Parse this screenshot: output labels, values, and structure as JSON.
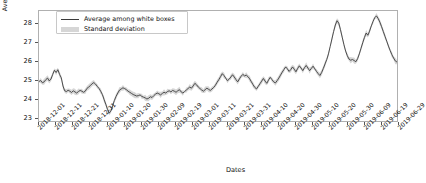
{
  "chart_data": {
    "type": "line",
    "title": "",
    "xlabel": "Dates",
    "ylabel": "Average RTT (milliseconds)",
    "ylim": [
      22.8,
      28.7
    ],
    "yticks": [
      23,
      24,
      25,
      26,
      27,
      28
    ],
    "grid": false,
    "legend_position": "upper left",
    "xtick_labels": [
      "2018-12-01",
      "2018-12-11",
      "2018-12-21",
      "2018-12-31",
      "2019-01-10",
      "2019-01-20",
      "2019-01-30",
      "2019-02-09",
      "2019-02-19",
      "2019-03-01",
      "2019-03-11",
      "2019-03-21",
      "2019-03-31",
      "2019-04-10",
      "2019-04-20",
      "2019-04-30",
      "2019-05-10",
      "2019-05-20",
      "2019-05-30",
      "2019-06-09",
      "2019-06-19",
      "2019-06-29"
    ],
    "x_start": "2018-12-01",
    "x_end": "2019-06-29",
    "series": [
      {
        "name": "Average among white boxes",
        "color": "#3b3b3b",
        "values": [
          24.92,
          24.97,
          24.85,
          24.9,
          25.02,
          25.1,
          24.95,
          25.05,
          25.3,
          25.52,
          25.4,
          25.55,
          25.3,
          25.12,
          24.68,
          24.42,
          24.38,
          24.45,
          24.4,
          24.33,
          24.42,
          24.36,
          24.3,
          24.38,
          24.44,
          24.4,
          24.34,
          24.4,
          24.55,
          24.62,
          24.7,
          24.8,
          24.86,
          24.78,
          24.66,
          24.55,
          24.4,
          24.22,
          23.95,
          23.7,
          23.42,
          23.22,
          23.35,
          23.62,
          23.9,
          24.12,
          24.3,
          24.46,
          24.52,
          24.58,
          24.54,
          24.48,
          24.4,
          24.34,
          24.28,
          24.22,
          24.18,
          24.14,
          24.16,
          24.2,
          24.12,
          24.08,
          24.04,
          23.98,
          24.02,
          24.1,
          24.06,
          24.16,
          24.24,
          24.3,
          24.26,
          24.2,
          24.28,
          24.34,
          24.3,
          24.38,
          24.42,
          24.36,
          24.44,
          24.4,
          24.34,
          24.42,
          24.48,
          24.36,
          24.3,
          24.38,
          24.46,
          24.54,
          24.62,
          24.56,
          24.68,
          24.82,
          24.74,
          24.62,
          24.54,
          24.46,
          24.4,
          24.48,
          24.56,
          24.5,
          24.44,
          24.52,
          24.6,
          24.72,
          24.88,
          25.02,
          25.18,
          25.34,
          25.24,
          25.1,
          24.96,
          25.04,
          25.16,
          25.28,
          25.16,
          25.02,
          24.9,
          25.06,
          25.2,
          25.3,
          25.22,
          25.26,
          25.18,
          25.06,
          24.9,
          24.74,
          24.6,
          24.52,
          24.66,
          24.8,
          24.94,
          25.08,
          24.94,
          24.82,
          25.0,
          25.14,
          25.02,
          24.9,
          24.84,
          24.96,
          25.1,
          25.26,
          25.42,
          25.56,
          25.7,
          25.6,
          25.46,
          25.56,
          25.7,
          25.58,
          25.44,
          25.62,
          25.76,
          25.64,
          25.5,
          25.66,
          25.78,
          25.64,
          25.5,
          25.62,
          25.74,
          25.6,
          25.46,
          25.34,
          25.24,
          25.4,
          25.62,
          25.86,
          26.1,
          26.4,
          26.8,
          27.2,
          27.6,
          27.95,
          28.18,
          28.05,
          27.7,
          27.3,
          26.9,
          26.55,
          26.3,
          26.12,
          26.06,
          26.1,
          26.04,
          25.98,
          26.14,
          26.4,
          26.7,
          27.0,
          27.28,
          27.52,
          27.4,
          27.62,
          27.9,
          28.14,
          28.34,
          28.44,
          28.3,
          28.1,
          27.86,
          27.6,
          27.34,
          27.08,
          26.82,
          26.58,
          26.36,
          26.18,
          26.02,
          25.96
        ]
      }
    ],
    "band": {
      "name": "Standard deviation",
      "color": "#d6d6d6",
      "half_width_avg": 0.09
    }
  }
}
